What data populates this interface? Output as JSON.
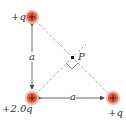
{
  "diagram": {
    "charges": [
      {
        "id": "top",
        "label": "+q",
        "sign": "+",
        "x": 32,
        "y": 17
      },
      {
        "id": "bottom-left",
        "label": "+2.0q",
        "sign": "+",
        "x": 32,
        "y": 98
      },
      {
        "id": "bottom-right",
        "label": "+q",
        "sign": "+",
        "x": 113,
        "y": 98
      }
    ],
    "point": {
      "label": "P",
      "x": 72,
      "y": 57
    },
    "dimensions": {
      "vertical": "a",
      "horizontal": "a"
    },
    "colors": {
      "charge_fill": "#e8553e",
      "charge_ring": "#f6b3a3",
      "dashed_line": "#aaaaaa",
      "arrow": "#444444"
    }
  }
}
